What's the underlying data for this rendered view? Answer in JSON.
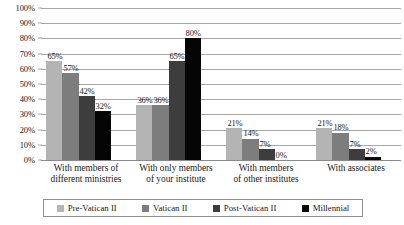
{
  "chart_data": {
    "type": "bar",
    "title": "",
    "xlabel": "",
    "ylabel": "",
    "ylim": [
      0,
      100
    ],
    "ytick_labels": [
      "100%",
      "90%",
      "80%",
      "70%",
      "60%",
      "50%",
      "40%",
      "30%",
      "20%",
      "10%",
      "0%"
    ],
    "ytick_values": [
      100,
      90,
      80,
      70,
      60,
      50,
      40,
      30,
      20,
      10,
      0
    ],
    "grid": true,
    "legend_position": "bottom",
    "value_suffix": "%",
    "categories": [
      "With members of different ministries",
      "With only members of your institute",
      "With members of other institutes",
      "With associates"
    ],
    "category_lines": [
      [
        "With members of",
        "different ministries"
      ],
      [
        "With only members",
        "of your institute"
      ],
      [
        "With members",
        "of other institutes"
      ],
      [
        "With associates",
        ""
      ]
    ],
    "series": [
      {
        "name": "Pre-Vatican II",
        "color": "#b4b4b4",
        "values": [
          65,
          36,
          21,
          21
        ],
        "labels": [
          "65%",
          "36%",
          "21%",
          "21%"
        ]
      },
      {
        "name": "Vatican II",
        "color": "#7d7d7d",
        "values": [
          57,
          36,
          14,
          18
        ],
        "labels": [
          "57%",
          "36%",
          "14%",
          "18%"
        ]
      },
      {
        "name": "Post-Vatican II",
        "color": "#3d3d3d",
        "values": [
          42,
          65,
          7,
          7
        ],
        "labels": [
          "42%",
          "65%",
          "7%",
          "7%"
        ]
      },
      {
        "name": "Millennial",
        "color": "#050505",
        "values": [
          32,
          80,
          0,
          2
        ],
        "labels": [
          "32%",
          "80%",
          "0%",
          "2%"
        ]
      }
    ]
  }
}
